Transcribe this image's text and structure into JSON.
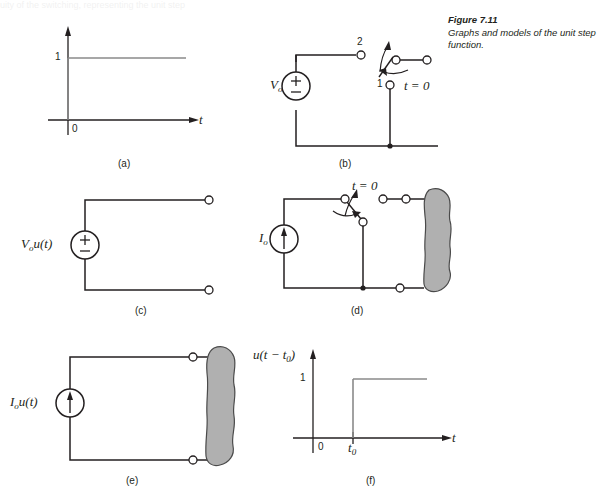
{
  "figure": {
    "caption_title": "Figure 7.11",
    "caption_body": "Graphs and models of the unit step function.",
    "top_remnant": "uity of the switching, representing the unit step"
  },
  "panels": {
    "a": {
      "label": "(a)",
      "y_tick": "1",
      "origin": "0",
      "x_axis_label": "t"
    },
    "b": {
      "label": "(b)",
      "source": "V",
      "source_sub": "o",
      "plus": "+",
      "minus": "−",
      "terminal_top": "2",
      "terminal_bottom": "1",
      "switch_time": "t = 0"
    },
    "c": {
      "label": "(c)",
      "source_text": "V",
      "source_sub": "o",
      "source_fn": "u(t)",
      "plus": "+",
      "minus": "−"
    },
    "d": {
      "label": "(d)",
      "source": "I",
      "source_sub": "o",
      "switch_time": "t = 0"
    },
    "e": {
      "label": "(e)",
      "source_text": "I",
      "source_sub": "o",
      "source_fn": "u(t)"
    },
    "f": {
      "label": "(f)",
      "y_axis_label": "u(t − t",
      "y_axis_sub": "0",
      "y_axis_close": ")",
      "y_tick": "1",
      "origin": "0",
      "step_tick": "t",
      "step_tick_sub": "0",
      "x_axis_label": "t"
    }
  },
  "colors": {
    "ink": "#231f20",
    "curve": "#8a8a8a",
    "shade_fill": "#b0b0b0",
    "shade_stroke": "#4a4a4a",
    "terminal_fill": "#ffffff"
  }
}
